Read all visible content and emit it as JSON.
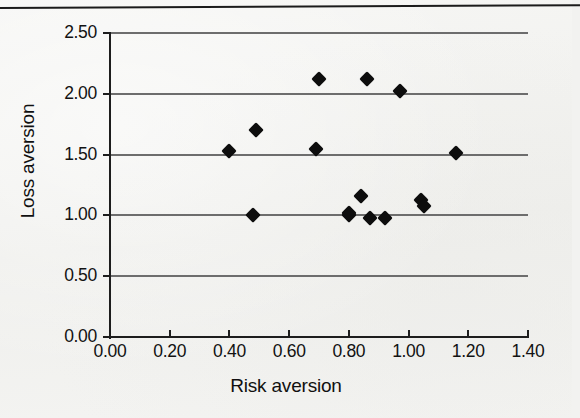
{
  "figure": {
    "background_color": "#f2f2f0",
    "ink_color": "#0d0d0d",
    "gridline_color": "#6d6d6d",
    "has_top_rule": true
  },
  "chart_data": {
    "type": "scatter",
    "title": "",
    "xlabel": "Risk aversion",
    "ylabel": "Loss aversion",
    "xlim": [
      0.0,
      1.4
    ],
    "ylim": [
      0.0,
      2.5
    ],
    "xticks": [
      "0.00",
      "0.20",
      "0.40",
      "0.60",
      "0.80",
      "1.00",
      "1.20",
      "1.40"
    ],
    "xtick_values": [
      0.0,
      0.2,
      0.4,
      0.6,
      0.8,
      1.0,
      1.2,
      1.4
    ],
    "yticks": [
      "0.00",
      "0.50",
      "1.00",
      "1.50",
      "2.00",
      "2.50"
    ],
    "ytick_values": [
      0.0,
      0.5,
      1.0,
      1.5,
      2.0,
      2.5
    ],
    "grid": "horizontal",
    "gridline_values": [
      0.5,
      1.0,
      1.5,
      2.0,
      2.5
    ],
    "legend": null,
    "marker": "filled-diamond",
    "marker_color": "#0d0d0d",
    "n_points": 15,
    "points": [
      {
        "x": 0.4,
        "y": 1.53
      },
      {
        "x": 0.48,
        "y": 1.0
      },
      {
        "x": 0.49,
        "y": 1.7
      },
      {
        "x": 0.69,
        "y": 1.55
      },
      {
        "x": 0.7,
        "y": 2.12
      },
      {
        "x": 0.8,
        "y": 1.0
      },
      {
        "x": 0.8,
        "y": 1.02
      },
      {
        "x": 0.84,
        "y": 1.16
      },
      {
        "x": 0.86,
        "y": 2.12
      },
      {
        "x": 0.87,
        "y": 0.98
      },
      {
        "x": 0.92,
        "y": 0.98
      },
      {
        "x": 0.97,
        "y": 2.02
      },
      {
        "x": 1.04,
        "y": 1.13
      },
      {
        "x": 1.05,
        "y": 1.08
      },
      {
        "x": 1.16,
        "y": 1.51
      }
    ]
  }
}
